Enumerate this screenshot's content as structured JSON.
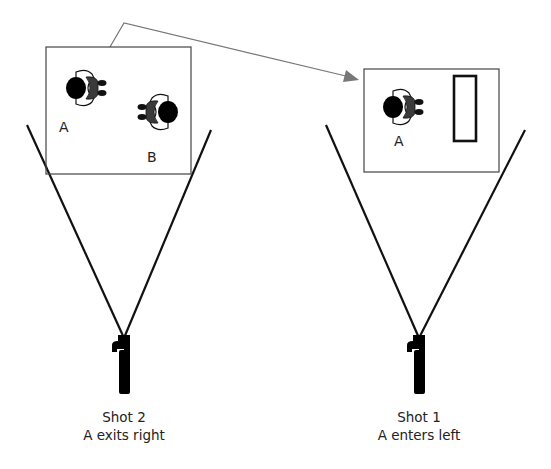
{
  "diagram": {
    "type": "camera-shot-continuity",
    "colors": {
      "frame_stroke": "#444444",
      "camera_lines": "#111111",
      "arrow": "#777777",
      "figure_body": "#000000",
      "figure_shirt": "#333333"
    },
    "arrow": {
      "from": "shot-2-frame",
      "to": "shot-1-frame",
      "label": ""
    },
    "shots": [
      {
        "id": "shot-2",
        "title": "Shot 2",
        "description": "A exits right",
        "characters": [
          {
            "label": "A",
            "facing": "right"
          },
          {
            "label": "B",
            "facing": "left"
          }
        ],
        "objects": []
      },
      {
        "id": "shot-1",
        "title": "Shot 1",
        "description": "A enters left",
        "characters": [
          {
            "label": "A",
            "facing": "right"
          }
        ],
        "objects": [
          {
            "shape": "rectangle",
            "name": "door-or-object"
          }
        ]
      }
    ]
  }
}
